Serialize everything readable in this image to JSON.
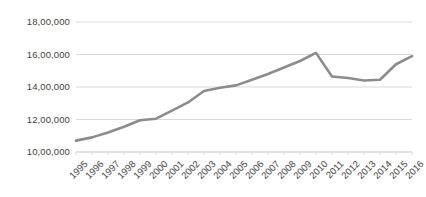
{
  "chart_data": {
    "type": "line",
    "title": "",
    "subtitle": "",
    "xlabel": "",
    "ylabel": "",
    "categories": [
      "1995",
      "1996",
      "1997",
      "1998",
      "1999",
      "2000",
      "2001",
      "2002",
      "2003",
      "2004",
      "2005",
      "2006",
      "2007",
      "2008",
      "2009",
      "2010",
      "2011",
      "2012",
      "2013",
      "2014",
      "2015",
      "2016"
    ],
    "series": [
      {
        "name": "Series 1",
        "color": "#8c8c8c",
        "values": [
          1070000,
          1090000,
          1120000,
          1155000,
          1195000,
          1205000,
          1255000,
          1305000,
          1375000,
          1395000,
          1410000,
          1445000,
          1480000,
          1520000,
          1560000,
          1610000,
          1465000,
          1455000,
          1440000,
          1445000,
          1540000,
          1590000
        ]
      }
    ],
    "ylim": [
      1000000,
      1800000
    ],
    "ytick_values": [
      1800000,
      1600000,
      1400000,
      1200000,
      1000000
    ],
    "ytick_labels": [
      "18,00,000",
      "16,00,000",
      "14,00,000",
      "12,00,000",
      "10,00,000"
    ],
    "grid": true,
    "grid_axis": "y",
    "legend": false,
    "legend_position": "none",
    "axis_line_color": "#d9d9d9",
    "grid_color": "#d9d9d9",
    "tick_label_color": "#3f3f3f",
    "background_color": "#ffffff",
    "number_format": "indian-lakh"
  },
  "plot_geometry": {
    "left": 76,
    "right": 412,
    "top": 22,
    "bottom": 152,
    "line_width": 2.6
  }
}
